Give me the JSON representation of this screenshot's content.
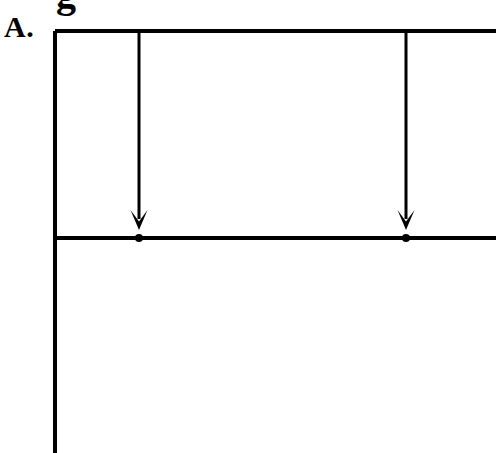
{
  "figure": {
    "panel_label": "A.",
    "caption_fragment_top_cutoff": "g",
    "background_color": "#ffffff",
    "ink_color": "#000000"
  },
  "chart_data": {
    "type": "diagram",
    "title": "",
    "subtitle": "",
    "xlabel": "",
    "ylabel": "",
    "grid": false,
    "legend": "none",
    "canvas": {
      "width": 496,
      "height": 453
    },
    "elements": [
      {
        "name": "left-vertical-axis",
        "kind": "line",
        "x1": 55,
        "y1": 31,
        "x2": 55,
        "y2": 453,
        "stroke_width": 4,
        "cropped_at": "bottom"
      },
      {
        "name": "upper-horizontal-rule",
        "kind": "line",
        "x1": 55,
        "y1": 31,
        "x2": 496,
        "y2": 31,
        "stroke_width": 4,
        "cropped_at": "right"
      },
      {
        "name": "lower-horizontal-rule",
        "kind": "line",
        "x1": 55,
        "y1": 238,
        "x2": 496,
        "y2": 238,
        "stroke_width": 4,
        "cropped_at": "right"
      },
      {
        "name": "drop-arrow-1",
        "kind": "arrow",
        "x": 139,
        "y_start": 31,
        "y_end": 230,
        "stroke_width": 3,
        "head": "solid-chevron",
        "head_width": 17,
        "head_height": 20,
        "direction": "down"
      },
      {
        "name": "drop-arrow-2",
        "kind": "arrow",
        "x": 406,
        "y_start": 31,
        "y_end": 230,
        "stroke_width": 3,
        "head": "solid-chevron",
        "head_width": 17,
        "head_height": 20,
        "direction": "down"
      },
      {
        "name": "node-marker-1",
        "kind": "dot",
        "cx": 139,
        "cy": 238,
        "r": 4
      },
      {
        "name": "node-marker-2",
        "kind": "dot",
        "cx": 406,
        "cy": 238,
        "r": 4
      }
    ]
  }
}
